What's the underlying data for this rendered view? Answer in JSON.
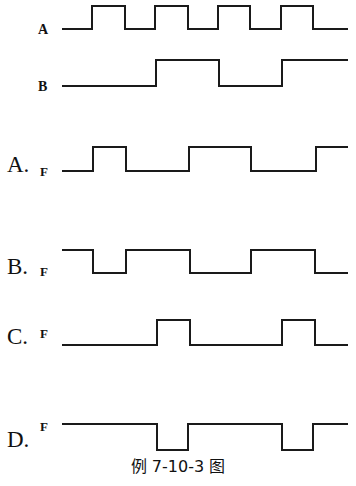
{
  "diagram": {
    "caption": "例 7-10-3 图",
    "inputs": [
      {
        "label": "A",
        "waveform": "0 1 0 1 0 1 0 1 0",
        "description": "clock-like square wave, 4 pulses"
      },
      {
        "label": "B",
        "waveform": "0 0 1 0 1",
        "description": "low, high, low, high"
      }
    ],
    "options": [
      {
        "option": "A.",
        "signal": "F",
        "description": "pulse, low, high, low, high"
      },
      {
        "option": "B.",
        "signal": "F",
        "description": "high, low, high, low, high, low"
      },
      {
        "option": "C.",
        "signal": "F",
        "description": "low with two pulses"
      },
      {
        "option": "D.",
        "signal": "F",
        "description": "high with two negative pulses"
      }
    ]
  }
}
